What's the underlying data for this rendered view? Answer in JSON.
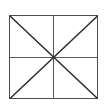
{
  "figure": {
    "background_color": "#ffffff",
    "canvas": {
      "width": 107,
      "height": 110
    },
    "geometry": {
      "rect": {
        "left": 9,
        "top": 15,
        "right": 98,
        "bottom": 99,
        "width": 89,
        "height": 84
      },
      "center": {
        "x": 53.5,
        "y": 57
      }
    },
    "style": {
      "border_color": "#4d4d4d",
      "midline_color": "#5a5a5a",
      "diagonal_color": "#2b2b2b",
      "border_width": 1.4,
      "midline_width": 1.3,
      "diagonal_width": 1.5
    },
    "elements": [
      {
        "name": "rectangle-border",
        "kind": "rectangle",
        "label": "Outer rectangle"
      },
      {
        "name": "vertical-midline",
        "kind": "line",
        "label": "Vertical midline",
        "x1": 53.5,
        "y1": 15,
        "x2": 53.5,
        "y2": 99
      },
      {
        "name": "horizontal-midline",
        "kind": "line",
        "label": "Horizontal midline",
        "x1": 9,
        "y1": 57,
        "x2": 98,
        "y2": 57
      },
      {
        "name": "diagonal-tl-br",
        "kind": "line",
        "label": "Diagonal top-left to bottom-right",
        "x1": 9,
        "y1": 15,
        "x2": 98,
        "y2": 99
      },
      {
        "name": "diagonal-bl-tr",
        "kind": "line",
        "label": "Diagonal bottom-left to top-right",
        "x1": 9,
        "y1": 99,
        "x2": 98,
        "y2": 15
      }
    ]
  }
}
